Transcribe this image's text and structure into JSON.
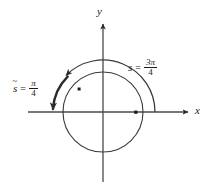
{
  "figure": {
    "background_color": "#ffffff",
    "stroke_color": "#3a3a3a",
    "text_color": "#1a1a1a"
  },
  "axes": {
    "x_label": "x",
    "y_label": "y",
    "origin": {
      "x": 103,
      "y": 112
    },
    "x_range_px": [
      28,
      190
    ],
    "y_range_px": [
      22,
      182
    ]
  },
  "circle": {
    "center": {
      "x": 103,
      "y": 112
    },
    "radius": 40,
    "name": "unit-circle"
  },
  "arcs": [
    {
      "name": "arc-s",
      "label_symbol": "s",
      "label_equals": "=",
      "label_value_numerator": "3π",
      "label_value_denominator": "4",
      "label_text": "s = 3π/4",
      "radius": 52,
      "start_angle_deg": 0,
      "end_angle_deg": 135,
      "direction": "counterclockwise",
      "arrowhead": "end"
    },
    {
      "name": "arc-s-tilde",
      "label_symbol": "s",
      "label_accent": "~",
      "label_equals": "=",
      "label_value_numerator": "π",
      "label_value_denominator": "4",
      "label_text": "s̃ = π/4",
      "radius": 50,
      "start_angle_deg": 135,
      "end_angle_deg": 180,
      "direction": "counterclockwise",
      "arrowhead": "end",
      "stroke_weight": "thick"
    }
  ],
  "points": [
    {
      "name": "point-terminal",
      "x": 79,
      "y": 89,
      "angle_deg": 135
    },
    {
      "name": "point-initial",
      "x": 136,
      "y": 112,
      "angle_deg": 0
    }
  ]
}
